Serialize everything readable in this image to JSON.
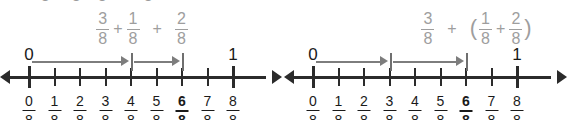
{
  "figure": {
    "colors": {
      "axis": "#2b2b2b",
      "hop_arrow": "#7d7d7d",
      "expression_text": "#9e9e9e",
      "label_text": "#1a1a1a",
      "background": "#ffffff"
    }
  },
  "cutoff_row": {
    "visible": true,
    "note": "bottom edge of a clipped fraction row above",
    "fragments": [
      {
        "text": "8",
        "x": 41
      },
      {
        "text": "8",
        "x": 72
      },
      {
        "text": "8",
        "x": 98
      },
      {
        "text": "8",
        "x": 144
      }
    ]
  },
  "panels": [
    {
      "id": "left",
      "expression": {
        "full_text": "3/8 + 1/8 + 2/8",
        "tokens": [
          {
            "type": "fraction",
            "numerator": "3",
            "denominator": "8"
          },
          {
            "type": "operator",
            "text": "+"
          },
          {
            "type": "fraction",
            "numerator": "1",
            "denominator": "8"
          },
          {
            "type": "operator",
            "text": "+",
            "wide": true
          },
          {
            "type": "fraction",
            "numerator": "2",
            "denominator": "8"
          }
        ]
      },
      "number_line": {
        "start_label": "0",
        "end_label": "1",
        "ticks": 9,
        "labels": [
          {
            "numerator": "0",
            "denominator": "8",
            "bold": false
          },
          {
            "numerator": "1",
            "denominator": "8",
            "bold": false
          },
          {
            "numerator": "2",
            "denominator": "8",
            "bold": false
          },
          {
            "numerator": "3",
            "denominator": "8",
            "bold": false
          },
          {
            "numerator": "4",
            "denominator": "8",
            "bold": false
          },
          {
            "numerator": "5",
            "denominator": "8",
            "bold": false
          },
          {
            "numerator": "6",
            "denominator": "8",
            "bold": true
          },
          {
            "numerator": "7",
            "denominator": "8",
            "bold": false
          },
          {
            "numerator": "8",
            "denominator": "8",
            "bold": false
          }
        ],
        "hops": [
          {
            "from": 0,
            "to": 4,
            "label": "3/8 + 1/8"
          },
          {
            "from": 4,
            "to": 6,
            "label": "2/8"
          }
        ],
        "result": "6/8"
      }
    },
    {
      "id": "right",
      "expression": {
        "full_text": "3/8 + (1/8 + 2/8)",
        "tokens": [
          {
            "type": "fraction",
            "numerator": "3",
            "denominator": "8"
          },
          {
            "type": "operator",
            "text": "+",
            "wide": true
          },
          {
            "type": "paren",
            "text": "("
          },
          {
            "type": "fraction",
            "numerator": "1",
            "denominator": "8"
          },
          {
            "type": "operator",
            "text": "+"
          },
          {
            "type": "fraction",
            "numerator": "2",
            "denominator": "8"
          },
          {
            "type": "paren",
            "text": ")"
          }
        ]
      },
      "number_line": {
        "start_label": "0",
        "end_label": "1",
        "ticks": 9,
        "labels": [
          {
            "numerator": "0",
            "denominator": "8",
            "bold": false
          },
          {
            "numerator": "1",
            "denominator": "8",
            "bold": false
          },
          {
            "numerator": "2",
            "denominator": "8",
            "bold": false
          },
          {
            "numerator": "3",
            "denominator": "8",
            "bold": false
          },
          {
            "numerator": "4",
            "denominator": "8",
            "bold": false
          },
          {
            "numerator": "5",
            "denominator": "8",
            "bold": false
          },
          {
            "numerator": "6",
            "denominator": "8",
            "bold": true
          },
          {
            "numerator": "7",
            "denominator": "8",
            "bold": false
          },
          {
            "numerator": "8",
            "denominator": "8",
            "bold": false
          }
        ],
        "hops": [
          {
            "from": 0,
            "to": 3,
            "label": "3/8"
          },
          {
            "from": 3,
            "to": 6,
            "label": "1/8 + 2/8"
          }
        ],
        "result": "6/8"
      }
    }
  ]
}
